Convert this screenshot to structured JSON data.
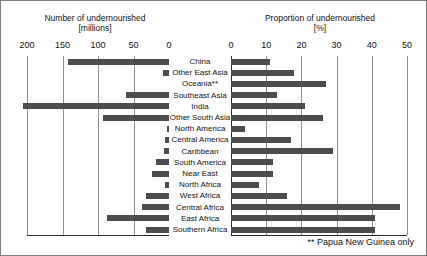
{
  "chart_data": {
    "type": "bar",
    "orientation": "horizontal",
    "layout": "back-to-back butterfly, two panels sharing one category axis",
    "title": "",
    "categories": [
      "China",
      "Other East Asia",
      "Oceania**",
      "Southeast Asia",
      "India",
      "Other South Asia",
      "North America",
      "Central America",
      "Caribbean",
      "South America",
      "Near East",
      "North Africa",
      "West Africa",
      "Central Africa",
      "East Africa",
      "Southern Africa"
    ],
    "panels": [
      {
        "id": "left",
        "title_line1": "Number of undernourished",
        "title_line2": "[millions]",
        "xlabel": "Number of undernourished [millions]",
        "unit": "millions",
        "xlim": [
          200,
          0
        ],
        "direction": "right-to-left",
        "ticks": [
          200,
          150,
          100,
          50,
          0
        ],
        "tick_labels": [
          "200",
          "150",
          "100",
          "50",
          "0"
        ],
        "grid": true,
        "values": [
          142,
          8,
          0,
          60,
          205,
          93,
          3,
          5,
          7,
          18,
          24,
          5,
          32,
          38,
          87,
          33
        ]
      },
      {
        "id": "right",
        "title_line1": "Proportion of undernourished",
        "title_line2": "[%]",
        "xlabel": "Proportion of undernourished [%]",
        "unit": "%",
        "xlim": [
          0,
          50
        ],
        "direction": "left-to-right",
        "ticks": [
          0,
          10,
          20,
          30,
          40,
          50
        ],
        "tick_labels": [
          "0",
          "10",
          "20",
          "30",
          "40",
          "50"
        ],
        "grid": true,
        "values": [
          11,
          18,
          27,
          13,
          21,
          26,
          4,
          17,
          29,
          12,
          12,
          8,
          16,
          48,
          41,
          41
        ]
      }
    ],
    "series": [
      {
        "name": "Number of undernourished [millions]",
        "panel": "left",
        "values": [
          142,
          8,
          0,
          60,
          205,
          93,
          3,
          5,
          7,
          18,
          24,
          5,
          32,
          38,
          87,
          33
        ]
      },
      {
        "name": "Proportion of undernourished [%]",
        "panel": "right",
        "values": [
          11,
          18,
          27,
          13,
          21,
          26,
          4,
          17,
          29,
          12,
          12,
          8,
          16,
          48,
          41,
          41
        ]
      }
    ],
    "annotations": [
      "** Papua New Guinea only"
    ],
    "legend": null,
    "bar_color": "#4d4d4d",
    "grid_color": "#8f8f8f",
    "axis_color": "#2b2b2b"
  },
  "footnote": "** Papua New Guinea only"
}
